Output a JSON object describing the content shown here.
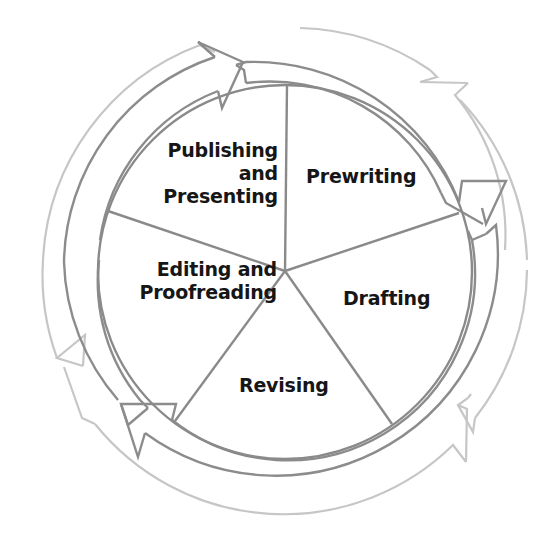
{
  "diagram": {
    "type": "cycle-pie",
    "center": {
      "x": 285,
      "y": 270
    },
    "colors": {
      "background": "#ffffff",
      "text": "#161616",
      "divider": "#8a8a8a",
      "inner_ring": "#8a8a8a",
      "outer_ring": "#c4c4c4"
    },
    "stages": [
      {
        "id": "prewriting",
        "lines": [
          "Prewriting"
        ]
      },
      {
        "id": "drafting",
        "lines": [
          "Drafting"
        ]
      },
      {
        "id": "revising",
        "lines": [
          "Revising"
        ]
      },
      {
        "id": "editing",
        "lines": [
          "Editing and",
          "Proofreading"
        ]
      },
      {
        "id": "publishing",
        "lines": [
          "Publishing",
          "and",
          "Presenting"
        ]
      }
    ],
    "arrows": {
      "inner_cycle_direction": "clockwise",
      "outer_cycle_direction": "counterclockwise",
      "inner_arrow_count": 3,
      "outer_arrow_count": 3
    }
  }
}
